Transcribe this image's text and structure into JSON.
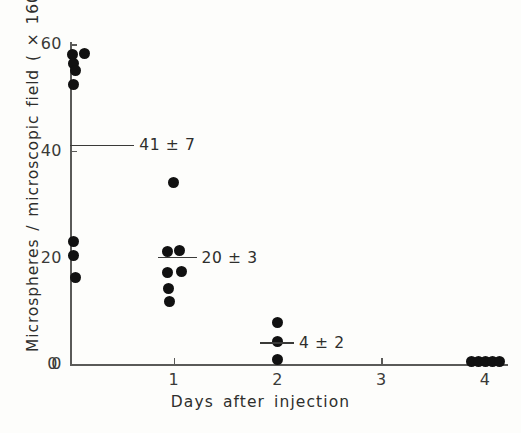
{
  "chart_data": {
    "type": "scatter",
    "title": "",
    "xlabel": "Days after injection",
    "ylabel": "Microspheres / microscopic field ( × 160 mag)",
    "xlim": [
      0,
      4.2
    ],
    "ylim": [
      0,
      63
    ],
    "grid": false,
    "legend": null,
    "xticks": [
      0,
      1,
      2,
      3,
      4
    ],
    "xtick_labels": [
      "0",
      "1",
      "2",
      "3",
      "4"
    ],
    "yticks": [
      0,
      20,
      40,
      60
    ],
    "ytick_labels": [
      "0",
      "20",
      "40",
      "60"
    ],
    "series": [
      {
        "name": "Microspheres per microscopic field",
        "marker": "filled-circle",
        "color": "#111111",
        "points": [
          {
            "x": 0.02,
            "y": 58.0
          },
          {
            "x": 0.14,
            "y": 58.2
          },
          {
            "x": 0.03,
            "y": 56.3
          },
          {
            "x": 0.05,
            "y": 55.0
          },
          {
            "x": 0.03,
            "y": 52.5
          },
          {
            "x": 0.03,
            "y": 23.0
          },
          {
            "x": 0.03,
            "y": 20.4
          },
          {
            "x": 0.05,
            "y": 16.2
          },
          {
            "x": 1.0,
            "y": 34.0
          },
          {
            "x": 0.94,
            "y": 21.2
          },
          {
            "x": 1.06,
            "y": 21.4
          },
          {
            "x": 0.94,
            "y": 17.3
          },
          {
            "x": 1.07,
            "y": 17.4
          },
          {
            "x": 0.95,
            "y": 14.3
          },
          {
            "x": 0.96,
            "y": 11.8
          },
          {
            "x": 2.0,
            "y": 7.8
          },
          {
            "x": 2.0,
            "y": 4.2
          },
          {
            "x": 2.0,
            "y": 0.9
          },
          {
            "x": 3.87,
            "y": 0.5
          },
          {
            "x": 3.94,
            "y": 0.5
          },
          {
            "x": 4.0,
            "y": 0.5
          },
          {
            "x": 4.07,
            "y": 0.5
          },
          {
            "x": 4.14,
            "y": 0.5
          }
        ]
      }
    ],
    "means": [
      {
        "x": 0,
        "y": 41,
        "label": "41 ± 7",
        "mean": 41,
        "sd": 7,
        "bar_start_x": 0.0,
        "bar_end_x": 0.62
      },
      {
        "x": 1,
        "y": 20,
        "label": "20 ± 3",
        "mean": 20,
        "sd": 3,
        "bar_start_x": 0.85,
        "bar_end_x": 1.22
      },
      {
        "x": 2,
        "y": 4,
        "label": "4 ± 2",
        "mean": 4,
        "sd": 2,
        "bar_start_x": 1.83,
        "bar_end_x": 2.16
      }
    ]
  }
}
